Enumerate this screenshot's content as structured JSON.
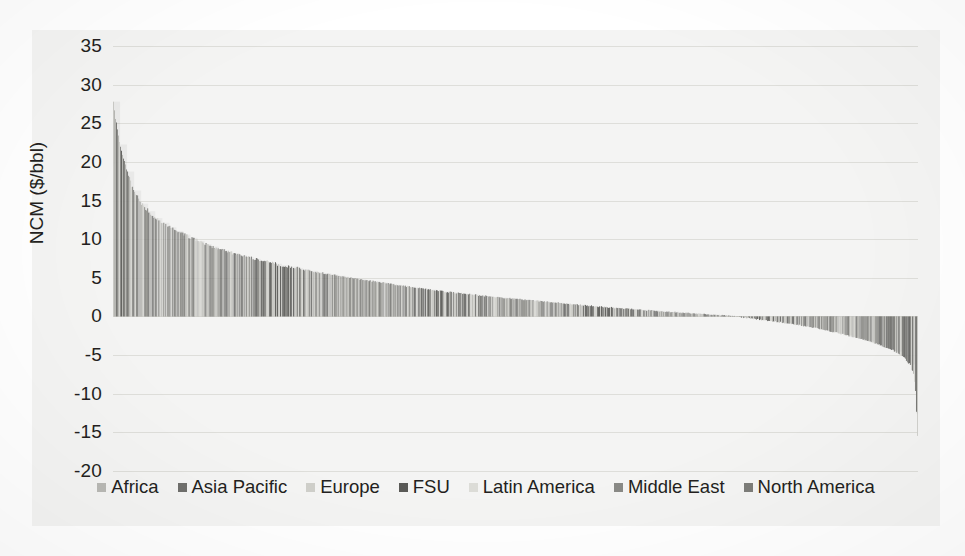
{
  "chart_data": {
    "type": "bar",
    "title": "",
    "subtitle": "",
    "xlabel": "",
    "ylabel": "NCM ($/bbl)",
    "ylim": [
      -20,
      35
    ],
    "yticks": [
      35,
      30,
      25,
      20,
      15,
      10,
      5,
      0,
      -5,
      -10,
      -15,
      -20
    ],
    "ytick_labels": [
      "35",
      "30",
      "25",
      "20",
      "15",
      "10",
      "5",
      "0",
      "-5",
      "-10",
      "-15",
      "-20"
    ],
    "grid": true,
    "grid_axis": "y",
    "legend_position": "bottom",
    "sorted": "descending",
    "categories_count": 800,
    "legend": [
      {
        "name": "Africa",
        "color": "#b9b9b5"
      },
      {
        "name": "Asia Pacific",
        "color": "#6f6f6c"
      },
      {
        "name": "Europe",
        "color": "#cfcfca"
      },
      {
        "name": "FSU",
        "color": "#5a5a57"
      },
      {
        "name": "Latin America",
        "color": "#dcdcd7"
      },
      {
        "name": "Middle East",
        "color": "#8a8a86"
      },
      {
        "name": "North America",
        "color": "#7d7d79"
      }
    ],
    "series": [
      {
        "name": "NCM ($/bbl)",
        "note": "Values are the sorted per-asset net cash margin read off the curve; index 0 is the highest-margin asset.",
        "curve_anchors": [
          {
            "index": 0,
            "value": 27.8
          },
          {
            "index": 4,
            "value": 24.0
          },
          {
            "index": 10,
            "value": 20.5
          },
          {
            "index": 18,
            "value": 17.0
          },
          {
            "index": 28,
            "value": 14.6
          },
          {
            "index": 40,
            "value": 12.9
          },
          {
            "index": 55,
            "value": 11.6
          },
          {
            "index": 70,
            "value": 10.6
          },
          {
            "index": 90,
            "value": 9.4
          },
          {
            "index": 110,
            "value": 8.5
          },
          {
            "index": 135,
            "value": 7.6
          },
          {
            "index": 165,
            "value": 6.7
          },
          {
            "index": 200,
            "value": 5.8
          },
          {
            "index": 240,
            "value": 4.9
          },
          {
            "index": 285,
            "value": 4.0
          },
          {
            "index": 330,
            "value": 3.2
          },
          {
            "index": 380,
            "value": 2.5
          },
          {
            "index": 430,
            "value": 1.9
          },
          {
            "index": 480,
            "value": 1.3
          },
          {
            "index": 530,
            "value": 0.8
          },
          {
            "index": 575,
            "value": 0.4
          },
          {
            "index": 610,
            "value": 0.1
          },
          {
            "index": 630,
            "value": -0.2
          },
          {
            "index": 660,
            "value": -0.7
          },
          {
            "index": 690,
            "value": -1.3
          },
          {
            "index": 715,
            "value": -2.0
          },
          {
            "index": 740,
            "value": -2.8
          },
          {
            "index": 760,
            "value": -3.6
          },
          {
            "index": 775,
            "value": -4.4
          },
          {
            "index": 786,
            "value": -5.3
          },
          {
            "index": 792,
            "value": -6.4
          },
          {
            "index": 795,
            "value": -7.6
          },
          {
            "index": 797,
            "value": -9.5
          },
          {
            "index": 799,
            "value": -15.6
          }
        ],
        "max_value": 27.8,
        "min_value": -15.6,
        "zero_crossing_index": 620
      }
    ]
  }
}
